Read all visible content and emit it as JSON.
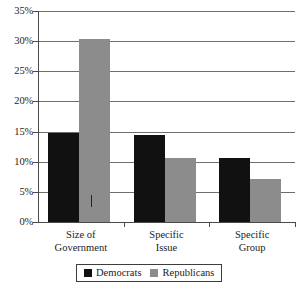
{
  "chart_data": {
    "type": "bar",
    "title": "",
    "subtitle": "",
    "xlabel": "",
    "ylabel": "",
    "ylim": [
      0,
      35
    ],
    "ytick_step": 5,
    "grid": true,
    "legend_position": "bottom",
    "categories": [
      "Size of Government",
      "Specific Issue",
      "Specific Group"
    ],
    "category_lines": [
      [
        "Size of",
        "Government"
      ],
      [
        "Specific",
        "Issue"
      ],
      [
        "Specific",
        "Group"
      ]
    ],
    "ytick_labels": [
      "0%",
      "5%",
      "10%",
      "15%",
      "20%",
      "25%",
      "30%",
      "35%"
    ],
    "ytick_values": [
      0,
      5,
      10,
      15,
      20,
      25,
      30,
      35
    ],
    "series": [
      {
        "name": "Democrats",
        "color": "#111111",
        "values": [
          14.7,
          14.5,
          10.6
        ]
      },
      {
        "name": "Republicans",
        "color": "#8c8c8c",
        "values": [
          30.3,
          10.7,
          7.1
        ]
      }
    ]
  },
  "legend": {
    "items": [
      {
        "label": "Democrats",
        "color": "#111111"
      },
      {
        "label": "Republicans",
        "color": "#8c8c8c"
      }
    ]
  },
  "colors": {
    "democrats": "#111111",
    "republicans": "#8c8c8c",
    "gridline": "#6f6f6f",
    "axis": "#4a4a4a",
    "background": "#ffffff",
    "text": "#1c1c1c"
  }
}
